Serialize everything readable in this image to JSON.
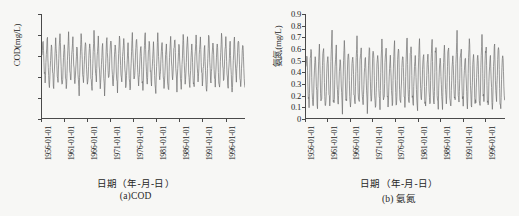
{
  "figure": {
    "background_color": "#f7f7f5",
    "series_color": "#6e6e6e",
    "axis_color": "#4a4a4a"
  },
  "panels": [
    {
      "key": "cod",
      "caption": "(a)COD",
      "xlabel": "日期（年-月-日）",
      "ylabel": "COD(mg/L)"
    },
    {
      "key": "ammonia",
      "caption": "(b) 氨氮",
      "xlabel": "日期（年-月-日）",
      "ylabel": "氨氮(mg/L)"
    }
  ],
  "chart_data": [
    {
      "type": "line",
      "key": "cod",
      "title": "(a)COD",
      "xlabel": "日期（年-月-日）",
      "ylabel": "COD(mg/L)",
      "ylim": [
        0,
        25
      ],
      "yticks": [
        0,
        5,
        10,
        15,
        20,
        25
      ],
      "ytick_labels": [
        "0",
        "5",
        "10",
        "15",
        "20",
        "25"
      ],
      "xticks": [
        "1956-01-01",
        "1961-01-01",
        "1966-01-01",
        "1971-01-01",
        "1976-01-01",
        "1981-01-01",
        "1986-01-01",
        "1991-01-01",
        "1996-01-01"
      ],
      "xlim": [
        "1956-01-01",
        "1999-12-31"
      ],
      "grid": false,
      "legend": "none",
      "series_name": "COD",
      "units": "mg/L",
      "value_range": [
        5.2,
        21.2
      ],
      "approx_mean": 13.1,
      "seasonal_period_years": 1,
      "values": [
        15.2,
        19.6,
        12.1,
        8.4,
        14.7,
        20.1,
        11.3,
        7.6,
        13.9,
        18.2,
        10.8,
        6.9,
        14.4,
        19.9,
        12.6,
        8.1,
        15.8,
        20.4,
        11.9,
        7.2,
        13.4,
        18.7,
        10.5,
        6.4,
        14.1,
        20.8,
        12.9,
        8.8,
        15.5,
        19.2,
        11.6,
        7.9,
        13.2,
        18.4,
        10.2,
        6.1,
        14.9,
        20.6,
        12.3,
        8.5,
        15.1,
        19.4,
        11.1,
        7.4,
        13.7,
        18.9,
        10.9,
        6.7,
        14.6,
        21.0,
        12.8,
        8.2,
        15.4,
        19.8,
        11.7,
        7.1,
        13.1,
        18.1,
        10.4,
        5.8,
        14.3,
        20.3,
        12.2,
        8.7,
        15.9,
        19.5,
        11.4,
        7.7,
        13.8,
        18.6,
        10.7,
        6.3,
        14.8,
        20.9,
        12.5,
        8.3,
        15.3,
        19.1,
        11.8,
        7.3,
        13.5,
        18.3,
        10.1,
        5.9,
        14.2,
        20.5,
        12.7,
        8.9,
        15.6,
        19.7,
        11.2,
        7.5,
        13.3,
        18.8,
        10.6,
        6.6,
        14.5,
        21.1,
        12.4,
        8.0,
        15.7,
        19.3,
        11.5,
        7.8,
        13.6,
        18.5,
        10.3,
        6.2,
        14.0,
        20.7,
        12.0,
        8.6,
        15.0,
        19.0,
        11.0,
        7.0,
        13.0,
        18.0,
        10.0,
        6.0,
        14.9,
        20.2,
        12.6,
        8.4,
        15.8,
        19.6,
        11.9,
        7.6,
        13.9,
        18.2,
        10.8,
        6.8,
        14.4,
        21.2,
        12.1,
        8.1,
        15.2,
        19.9,
        11.3,
        7.2,
        13.4,
        18.7,
        10.5,
        6.5,
        14.7,
        20.0,
        12.9,
        8.8,
        15.5,
        19.4,
        11.6,
        7.9,
        13.2,
        18.4,
        10.2,
        6.0,
        14.1,
        20.6,
        12.3,
        8.5,
        15.1,
        19.2,
        11.1,
        7.4,
        13.7,
        18.9,
        10.9,
        6.9,
        14.6,
        20.8,
        12.8,
        8.2,
        15.4,
        19.8,
        11.7,
        7.1,
        13.1,
        18.1,
        10.4,
        5.7,
        14.3,
        20.3,
        12.2,
        8.7,
        15.9,
        19.5,
        11.4,
        7.7,
        13.8,
        18.6,
        10.7,
        6.4
      ]
    },
    {
      "type": "line",
      "key": "ammonia",
      "title": "(b) 氨氮",
      "xlabel": "日期（年-月-日）",
      "ylabel": "氨氮(mg/L)",
      "ylim": [
        0,
        0.9
      ],
      "yticks": [
        0,
        0.1,
        0.2,
        0.3,
        0.4,
        0.5,
        0.6,
        0.7,
        0.8,
        0.9
      ],
      "ytick_labels": [
        "0",
        "0.1",
        "0.2",
        "0.3",
        "0.4",
        "0.5",
        "0.6",
        "0.7",
        "0.8",
        "0.9"
      ],
      "xticks": [
        "1956-01-01",
        "1961-01-01",
        "1966-01-01",
        "1971-01-01",
        "1976-01-01",
        "1981-01-01",
        "1986-01-01",
        "1991-01-01",
        "1996-01-01"
      ],
      "xlim": [
        "1956-01-01",
        "1999-12-31"
      ],
      "grid": false,
      "legend": "none",
      "series_name": "氨氮",
      "units": "mg/L",
      "value_range": [
        0.05,
        0.78
      ],
      "approx_mean": 0.4,
      "seasonal_period_years": 1,
      "values": [
        0.45,
        0.58,
        0.22,
        0.09,
        0.5,
        0.62,
        0.18,
        0.12,
        0.42,
        0.55,
        0.26,
        0.07,
        0.48,
        0.66,
        0.21,
        0.14,
        0.53,
        0.6,
        0.17,
        0.1,
        0.44,
        0.57,
        0.24,
        0.08,
        0.51,
        0.77,
        0.19,
        0.13,
        0.46,
        0.63,
        0.23,
        0.11,
        0.41,
        0.54,
        0.27,
        0.06,
        0.49,
        0.68,
        0.2,
        0.15,
        0.52,
        0.59,
        0.16,
        0.09,
        0.43,
        0.56,
        0.25,
        0.12,
        0.47,
        0.71,
        0.22,
        0.1,
        0.54,
        0.61,
        0.18,
        0.14,
        0.4,
        0.53,
        0.28,
        0.05,
        0.5,
        0.65,
        0.21,
        0.13,
        0.55,
        0.58,
        0.17,
        0.11,
        0.45,
        0.57,
        0.24,
        0.08,
        0.49,
        0.73,
        0.2,
        0.16,
        0.52,
        0.6,
        0.19,
        0.12,
        0.42,
        0.55,
        0.26,
        0.07,
        0.48,
        0.67,
        0.23,
        0.1,
        0.53,
        0.62,
        0.15,
        0.14,
        0.44,
        0.59,
        0.27,
        0.09,
        0.46,
        0.75,
        0.21,
        0.13,
        0.56,
        0.64,
        0.18,
        0.11,
        0.43,
        0.54,
        0.25,
        0.06,
        0.51,
        0.69,
        0.22,
        0.15,
        0.47,
        0.58,
        0.16,
        0.12,
        0.4,
        0.56,
        0.29,
        0.08,
        0.5,
        0.72,
        0.2,
        0.1,
        0.55,
        0.63,
        0.17,
        0.13,
        0.45,
        0.52,
        0.24,
        0.07,
        0.49,
        0.66,
        0.23,
        0.14,
        0.54,
        0.61,
        0.19,
        0.09,
        0.41,
        0.57,
        0.26,
        0.11,
        0.48,
        0.76,
        0.21,
        0.16,
        0.53,
        0.6,
        0.18,
        0.12,
        0.44,
        0.55,
        0.28,
        0.06,
        0.52,
        0.7,
        0.22,
        0.1,
        0.46,
        0.59,
        0.15,
        0.13,
        0.42,
        0.58,
        0.25,
        0.08,
        0.5,
        0.74,
        0.2,
        0.14,
        0.56,
        0.62,
        0.17,
        0.11,
        0.43,
        0.53,
        0.27,
        0.05,
        0.47,
        0.68,
        0.24,
        0.15,
        0.51,
        0.65,
        0.18,
        0.09,
        0.45,
        0.57,
        0.23,
        0.12
      ]
    }
  ]
}
